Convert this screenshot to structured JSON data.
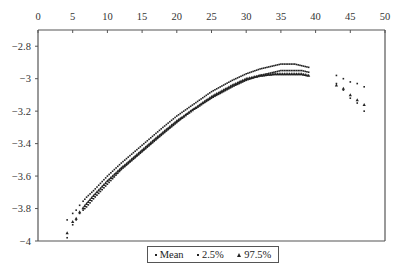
{
  "chart_data": {
    "type": "scatter",
    "title": "",
    "xlabel": "",
    "ylabel": "",
    "xlim": [
      0,
      50
    ],
    "ylim": [
      -4,
      -2.7
    ],
    "x_ticks": [
      0,
      5,
      10,
      15,
      20,
      25,
      30,
      35,
      40,
      45,
      50
    ],
    "y_ticks": [
      -2.8,
      -3,
      -3.2,
      -3.4,
      -3.6,
      -3.8,
      -4
    ],
    "y_tick_labels": [
      "-2.8",
      "-3",
      "-3.2",
      "-3.4",
      "-3.6",
      "-3.8",
      "-4"
    ],
    "x_axis_position": "top",
    "grid": false,
    "legend_position": "bottom",
    "series": [
      {
        "name": "Mean",
        "marker": "small-dot",
        "x": [
          4.2,
          5,
          5.5,
          6,
          7,
          8,
          10,
          12,
          15,
          18,
          20,
          22,
          25,
          28,
          30,
          32,
          34,
          35,
          36,
          37,
          38,
          39,
          43,
          44,
          45,
          46,
          47
        ],
        "y": [
          -3.98,
          -3.9,
          -3.87,
          -3.83,
          -3.79,
          -3.74,
          -3.65,
          -3.56,
          -3.45,
          -3.34,
          -3.27,
          -3.2,
          -3.12,
          -3.05,
          -3.01,
          -2.98,
          -2.96,
          -2.95,
          -2.95,
          -2.95,
          -2.95,
          -2.96,
          -3.03,
          -3.07,
          -3.12,
          -3.15,
          -3.2
        ]
      },
      {
        "name": "2.5%",
        "marker": "small-dot",
        "x": [
          4.2,
          5,
          5.5,
          6,
          7,
          8,
          10,
          12,
          15,
          18,
          20,
          22,
          25,
          28,
          30,
          32,
          34,
          35,
          36,
          37,
          38,
          39,
          43,
          44,
          45,
          46,
          47
        ],
        "y": [
          -3.87,
          -3.83,
          -3.81,
          -3.78,
          -3.73,
          -3.69,
          -3.6,
          -3.52,
          -3.41,
          -3.3,
          -3.23,
          -3.17,
          -3.08,
          -3.01,
          -2.97,
          -2.94,
          -2.92,
          -2.91,
          -2.91,
          -2.91,
          -2.92,
          -2.93,
          -2.98,
          -3.0,
          -3.02,
          -3.03,
          -3.05
        ]
      },
      {
        "name": "97.5%",
        "marker": "triangle",
        "x": [
          4.2,
          5,
          5.5,
          6,
          7,
          8,
          10,
          12,
          15,
          18,
          20,
          22,
          25,
          28,
          30,
          32,
          34,
          35,
          36,
          37,
          38,
          39,
          43,
          44,
          45,
          46,
          47
        ],
        "y": [
          -3.95,
          -3.88,
          -3.86,
          -3.82,
          -3.77,
          -3.72,
          -3.63,
          -3.55,
          -3.44,
          -3.33,
          -3.26,
          -3.2,
          -3.11,
          -3.04,
          -3.0,
          -2.98,
          -2.97,
          -2.97,
          -2.97,
          -2.97,
          -2.97,
          -2.98,
          -3.04,
          -3.06,
          -3.1,
          -3.13,
          -3.16
        ]
      }
    ]
  },
  "legend": {
    "items": [
      {
        "label": "Mean",
        "marker": "dot"
      },
      {
        "label": "2.5%",
        "marker": "dot"
      },
      {
        "label": "97.5%",
        "marker": "triangle"
      }
    ]
  },
  "colors": {
    "axis": "#555555",
    "marker": "#222222"
  }
}
